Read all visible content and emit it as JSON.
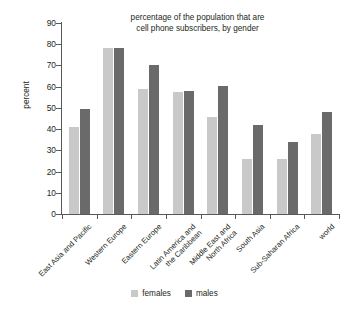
{
  "chart_data": {
    "type": "bar",
    "title": "percentage of the population that are\ncell phone subscribers, by gender",
    "xlabel": "",
    "ylabel": "percent",
    "ylim": [
      0,
      90
    ],
    "yticks": [
      0,
      10,
      20,
      30,
      40,
      50,
      60,
      70,
      80,
      90
    ],
    "grid": false,
    "legend_position": "bottom-center",
    "categories": [
      "East Asia and Pacific",
      "Western Europe",
      "Eastern Europe",
      "Latin America and\nthe Caribbean",
      "Middle East and\nNorth Africa",
      "South Asia",
      "Sub-Saharan Africa",
      "world"
    ],
    "series": [
      {
        "name": "females",
        "color": "#c9c9c9",
        "values": [
          41,
          78,
          59,
          57.5,
          45.5,
          26,
          26,
          37.5
        ]
      },
      {
        "name": "males",
        "color": "#6a6a6a",
        "values": [
          49.5,
          78,
          70,
          58,
          60.5,
          42,
          34,
          48
        ]
      }
    ]
  },
  "colors": {
    "females": "#c9c9c9",
    "males": "#6a6a6a",
    "axis": "#58595b",
    "text": "#231f20",
    "background": "#ffffff"
  }
}
